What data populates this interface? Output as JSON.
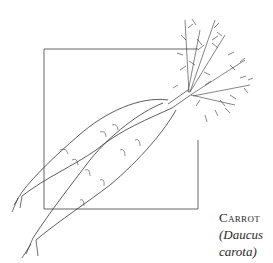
{
  "illustration": {
    "subject": "carrot-illustration",
    "stroke_color": "#333333",
    "box_color": "#555555"
  },
  "caption": {
    "common_name": "Carrot",
    "scientific_line1": "(Daucus",
    "scientific_line2": "carota)"
  }
}
